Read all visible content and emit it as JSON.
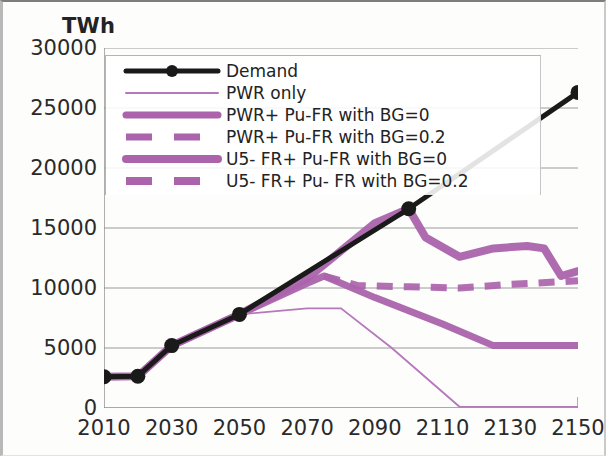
{
  "chart_data": {
    "type": "line",
    "title": "",
    "ylabel": "TWh",
    "xlabel": "",
    "xlim": [
      2010,
      2150
    ],
    "ylim": [
      0,
      30000
    ],
    "ytick_step": 5000,
    "xtick_step": 20,
    "grid": true,
    "legend_position": "upper-left-inside",
    "xticks": [
      "2010",
      "2030",
      "2050",
      "2070",
      "2090",
      "2110",
      "2130",
      "2150"
    ],
    "yticks": [
      "0",
      "5000",
      "10000",
      "15000",
      "20000",
      "25000",
      "30000"
    ],
    "colors": {
      "demand": "#1a1a1a",
      "purple": "#ab63ab",
      "purple_light": "#b678bb",
      "gridline": "#9a9a9a"
    },
    "series": [
      {
        "name": "Demand",
        "style": "solid-markers",
        "color": "#1a1a1a",
        "width": 5,
        "x": [
          2010,
          2020,
          2030,
          2050,
          2100,
          2150
        ],
        "values": [
          2600,
          2650,
          5200,
          7800,
          16600,
          26300
        ]
      },
      {
        "name": "PWR only",
        "style": "thin-solid",
        "color": "#b678bb",
        "width": 1.8,
        "x": [
          2010,
          2020,
          2030,
          2050,
          2070,
          2080,
          2095,
          2115,
          2150
        ],
        "values": [
          2600,
          2650,
          5200,
          7800,
          8300,
          8300,
          5000,
          100,
          100
        ]
      },
      {
        "name": "PWR+ Pu-FR with BG=0",
        "style": "thick-solid",
        "color": "#ab63ab",
        "width": 7,
        "x": [
          2010,
          2020,
          2030,
          2050,
          2070,
          2075,
          2090,
          2110,
          2125,
          2150
        ],
        "values": [
          2600,
          2650,
          5200,
          7800,
          10400,
          11000,
          9200,
          7000,
          5200,
          5200
        ]
      },
      {
        "name": "PWR+ Pu-FR with BG=0.2",
        "style": "thick-dashed",
        "color": "#ab63ab",
        "width": 7,
        "x": [
          2075,
          2085,
          2100,
          2115,
          2130,
          2150
        ],
        "values": [
          11000,
          10200,
          10100,
          10000,
          10300,
          10600
        ]
      },
      {
        "name": "U5- FR+ Pu-FR with BG=0",
        "style": "thick-solid",
        "color": "#ab63ab",
        "width": 8,
        "x": [
          2010,
          2020,
          2030,
          2050,
          2070,
          2090,
          2100,
          2105,
          2115,
          2125,
          2135,
          2140,
          2145,
          2150
        ],
        "values": [
          2600,
          2650,
          5200,
          7800,
          10800,
          15400,
          16600,
          14200,
          12600,
          13300,
          13500,
          13300,
          11000,
          11400
        ]
      },
      {
        "name": "U5- FR+ Pu- FR with BG=0.2",
        "style": "thick-dashed",
        "color": "#ab63ab",
        "width": 8,
        "x": [
          2010,
          2020,
          2030,
          2050,
          2070,
          2090,
          2100,
          2105,
          2115,
          2125,
          2135,
          2140,
          2145,
          2150
        ],
        "values": [
          2600,
          2650,
          5200,
          7800,
          10800,
          15400,
          16600,
          14200,
          12600,
          13300,
          13500,
          13300,
          11000,
          11400
        ]
      }
    ],
    "legend_entries": [
      {
        "label": "Demand",
        "key": "demand-marker-line"
      },
      {
        "label": "PWR only",
        "key": "thin-purple-line"
      },
      {
        "label": "PWR+ Pu-FR with BG=0",
        "key": "thick-purple-line"
      },
      {
        "label": "PWR+ Pu-FR with BG=0.2",
        "key": "thick-purple-dashed"
      },
      {
        "label": "U5- FR+ Pu-FR with BG=0",
        "key": "thick-purple-line-2"
      },
      {
        "label": "U5- FR+ Pu- FR with BG=0.2",
        "key": "thick-purple-dashed-2"
      }
    ]
  }
}
